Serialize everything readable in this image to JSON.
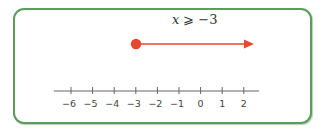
{
  "diagram": {
    "type": "number-line",
    "inequality": {
      "variable": "x",
      "operator": "⩾",
      "value": "−3",
      "full_text": "x ⩾ −3"
    },
    "solution": {
      "start": -3,
      "endpoint_style": "closed-dot",
      "direction": "right",
      "color": "#e8462e"
    },
    "axis": {
      "min": -6,
      "max": 2,
      "step": 1,
      "ticks": [
        {
          "value": -6,
          "label": "−6"
        },
        {
          "value": -5,
          "label": "−5"
        },
        {
          "value": -4,
          "label": "−4"
        },
        {
          "value": -3,
          "label": "−3"
        },
        {
          "value": -2,
          "label": "−2"
        },
        {
          "value": -1,
          "label": "−1"
        },
        {
          "value": 0,
          "label": "0"
        },
        {
          "value": 1,
          "label": "1"
        },
        {
          "value": 2,
          "label": "2"
        }
      ],
      "color": "#666666"
    },
    "frame": {
      "border_color": "#5a9e5c"
    }
  }
}
